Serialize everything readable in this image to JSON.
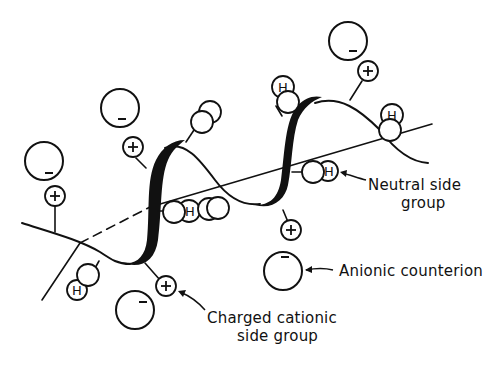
{
  "diagram": {
    "type": "schematic",
    "colors": {
      "ink": "#111111",
      "background": "#ffffff"
    },
    "labels": {
      "neutral": {
        "line1": "Neutral side",
        "line2": "group"
      },
      "anionic": {
        "line1": "Anionic counterion"
      },
      "cationic": {
        "line1": "Charged cationic",
        "line2": "side group"
      }
    },
    "symbols": {
      "plus": "+",
      "minus": "–",
      "hydrogen": "H"
    },
    "legend": [
      {
        "symbol": "small circle with +",
        "meaning": "Charged cationic side group"
      },
      {
        "symbol": "large circle with –",
        "meaning": "Anionic counterion"
      },
      {
        "symbol": "double circle with H",
        "meaning": "Neutral side group"
      }
    ]
  }
}
